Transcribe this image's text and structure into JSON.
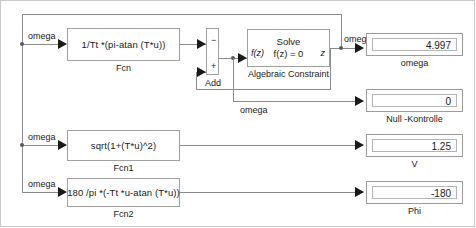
{
  "diagram": {
    "wire_color": "#8a8a8a",
    "block_border_color": "#a0a0a0"
  },
  "blocks": {
    "fcn": {
      "expression": "1/Tt *(pi-atan (T*u))",
      "label": "Fcn"
    },
    "fcn1": {
      "expression": "sqrt(1+(T*u)^2)",
      "label": "Fcn1"
    },
    "fcn2": {
      "expression": "180 /pi *(-Tt *u-atan (T*u))",
      "label": "Fcn2"
    },
    "add": {
      "label": "Add",
      "minus_sign": "−",
      "plus_sign": "+"
    },
    "algebraic_constraint": {
      "input_port_label": "f(z)",
      "output_port_label": "z",
      "line1": "Solve",
      "line2": "f(z) = 0",
      "label": "Algebraic Constraint"
    }
  },
  "displays": [
    {
      "value": "4.997",
      "label": "omega"
    },
    {
      "value": "0",
      "label": "Null -Kontrolle"
    },
    {
      "value": "1.25",
      "label": "V"
    },
    {
      "value": "-180",
      "label": "Phi"
    }
  ],
  "signal_labels": {
    "omega_fcn_in": "omega",
    "omega_fcn1_in": "omega",
    "omega_fcn2_in": "omega",
    "omega_alg_out": "omega",
    "omega_feedback": "omega"
  }
}
